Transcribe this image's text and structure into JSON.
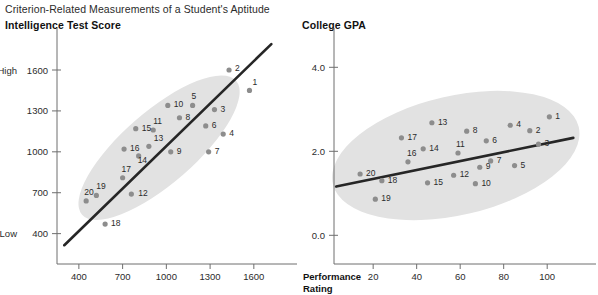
{
  "title": "Criterion-Related Measurements of a Student's Aptitude",
  "panels": [
    {
      "id": "intelligence",
      "title": "Intelligence Test Score",
      "x_axis": {
        "title_line1": "Performance",
        "title_line2": "Rating",
        "ticks": [
          "400",
          "700",
          "1000",
          "1300",
          "1600"
        ],
        "tick_values": [
          400,
          700,
          1000,
          1300,
          1600
        ],
        "range": [
          250,
          1800
        ]
      },
      "y_axis": {
        "ticks": [
          "400",
          "700",
          "1000",
          "1300",
          "1600"
        ],
        "tick_values": [
          400,
          700,
          1000,
          1300,
          1600
        ],
        "range": [
          280,
          1820
        ],
        "low_label": "Low",
        "high_label": "High"
      }
    },
    {
      "id": "gpa",
      "title": "College GPA",
      "x_axis": {
        "title_line1": "Performance",
        "title_line2": "Rating",
        "ticks": [
          "20",
          "40",
          "60",
          "80",
          "100"
        ],
        "tick_values": [
          20,
          40,
          60,
          80,
          100
        ],
        "range": [
          2,
          116
        ]
      },
      "y_axis": {
        "ticks": [
          "0.0",
          "2.0",
          "4.0"
        ],
        "tick_values": [
          0.0,
          2.0,
          4.0
        ],
        "range": [
          -0.35,
          4.65
        ]
      }
    }
  ],
  "chart_data": [
    {
      "type": "scatter",
      "title": "Intelligence Test Score",
      "xlabel": "Performance Rating",
      "ylabel": "Intelligence Test Score",
      "xlim": [
        250,
        1800
      ],
      "ylim": [
        280,
        1820
      ],
      "grid": false,
      "legend": "none",
      "point_labels": [
        "1",
        "2",
        "3",
        "4",
        "5",
        "6",
        "7",
        "8",
        "9",
        "10",
        "11",
        "12",
        "13",
        "14",
        "15",
        "16",
        "17",
        "18",
        "19",
        "20"
      ],
      "x": [
        1570,
        1430,
        1330,
        1390,
        1180,
        1270,
        1290,
        1090,
        1030,
        1010,
        910,
        760,
        880,
        810,
        790,
        710,
        700,
        580,
        520,
        450
      ],
      "y": [
        1450,
        1600,
        1310,
        1130,
        1340,
        1190,
        1000,
        1250,
        1000,
        1340,
        1160,
        690,
        1040,
        970,
        1170,
        1020,
        810,
        470,
        680,
        640
      ],
      "trendline": {
        "x": [
          300,
          1720
        ],
        "y": [
          315,
          1790
        ]
      },
      "ellipse": {
        "cx": 950,
        "cy": 1030,
        "rx": 700,
        "ry": 265,
        "rotation_deg": -41
      }
    },
    {
      "type": "scatter",
      "title": "College GPA",
      "xlabel": "Performance Rating",
      "ylabel": "College GPA",
      "xlim": [
        2,
        116
      ],
      "ylim": [
        -0.35,
        4.65
      ],
      "grid": false,
      "legend": "none",
      "point_labels": [
        "1",
        "2",
        "3",
        "4",
        "5",
        "6",
        "7",
        "8",
        "9",
        "10",
        "11",
        "12",
        "13",
        "14",
        "15",
        "16",
        "17",
        "18",
        "19",
        "20"
      ],
      "x": [
        101,
        92,
        96,
        83,
        85,
        72,
        74,
        63,
        69,
        67,
        59,
        57,
        47,
        43,
        45,
        36,
        33,
        24,
        21,
        14
      ],
      "y": [
        2.82,
        2.49,
        2.17,
        2.62,
        1.66,
        2.25,
        1.77,
        2.48,
        1.62,
        1.23,
        1.96,
        1.43,
        2.68,
        2.06,
        1.25,
        1.75,
        2.32,
        1.3,
        0.86,
        1.46
      ],
      "trendline": {
        "x": [
          3,
          112
        ],
        "y": [
          1.16,
          2.32
        ]
      },
      "ellipse": {
        "cx": 58,
        "cy": 1.9,
        "rx": 58,
        "ry": 1.42,
        "rotation_deg": -13
      }
    }
  ]
}
